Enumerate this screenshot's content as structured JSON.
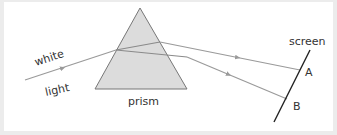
{
  "diagram": {
    "labels": {
      "white": "white",
      "light": "light",
      "prism": "prism",
      "screen": "screen",
      "point_a": "A",
      "point_b": "B"
    },
    "colors": {
      "background": "#ffffff",
      "frame": "#ececec",
      "prism_fill": "#dcdcdc",
      "prism_stroke": "#777777",
      "ray": "#9a9a9a",
      "screen_line": "#222222",
      "text": "#333333"
    },
    "elements": [
      {
        "id": "incident-ray",
        "description": "white light ray entering prism",
        "direction": "left-to-right"
      },
      {
        "id": "prism",
        "shape": "triangle"
      },
      {
        "id": "ray-a",
        "description": "refracted ray reaching screen at A"
      },
      {
        "id": "ray-b",
        "description": "refracted ray reaching screen at B"
      },
      {
        "id": "screen",
        "shape": "line"
      }
    ]
  }
}
